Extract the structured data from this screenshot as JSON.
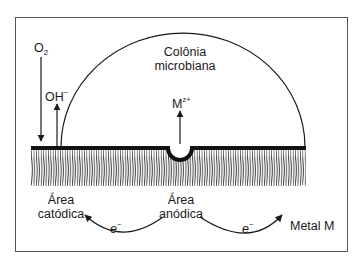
{
  "diagram": {
    "colony_label_line1": "Colônia",
    "colony_label_line2": "microbiana",
    "oxygen_label": "O",
    "oxygen_subscript": "2",
    "hydroxide_label": "OH",
    "hydroxide_superscript": "−",
    "metal_ion_label": "M",
    "metal_ion_superscript": "z+",
    "cathodic_line1": "Área",
    "cathodic_line2": "catódica",
    "anodic_line1": "Área",
    "anodic_line2": "anódica",
    "electron_left": "e",
    "electron_left_sup": "−",
    "electron_right": "e",
    "electron_right_sup": "−",
    "metal_label": "Metal M",
    "colors": {
      "line": "#1a1a1a",
      "frame": "#555555",
      "background": "#ffffff"
    }
  }
}
